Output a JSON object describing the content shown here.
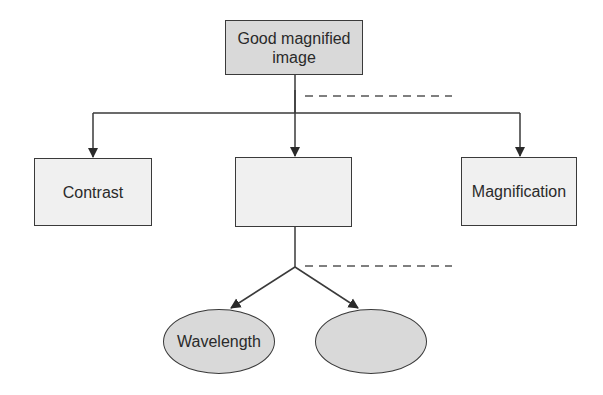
{
  "diagram": {
    "root": {
      "label": "Good magnified image",
      "line1": "Good magnified",
      "line2": "image",
      "fill": "#d9d9d9"
    },
    "level1": [
      {
        "label": "Contrast",
        "fill": "#f0f0f0"
      },
      {
        "label": "",
        "fill": "#f0f0f0"
      },
      {
        "label": "Magnification",
        "fill": "#f0f0f0"
      }
    ],
    "level2": [
      {
        "label": "Wavelength",
        "fill": "#d9d9d9"
      },
      {
        "label": "",
        "fill": "#d9d9d9"
      }
    ],
    "colors": {
      "line": "#3a3a3a",
      "dashed": "#555555"
    }
  }
}
